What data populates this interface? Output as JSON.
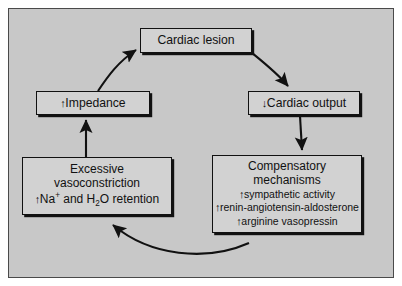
{
  "figure": {
    "type": "cycle-diagram",
    "background_color": "#c8c8c8",
    "node_fill_color": "#d2d2d2",
    "stroke_color": "#111111"
  },
  "nodes": {
    "cardiac_lesion": {
      "label": "Cardiac lesion"
    },
    "cardiac_output": {
      "arrow": "↓",
      "label": "Cardiac output"
    },
    "impedance": {
      "arrow": "↑",
      "label": "Impedance"
    },
    "vasoconstriction": {
      "line1": "Excessive",
      "line2": "vasoconstriction",
      "arrow": "↑",
      "ion": "Na",
      "ion_charge": "+",
      "mid": " and H",
      "water_sub": "2",
      "tail": "O retention"
    },
    "compensatory": {
      "line1": "Compensatory",
      "line2": "mechanisms",
      "items": [
        {
          "arrow": "↑",
          "label": "sympathetic activity"
        },
        {
          "arrow": "↑",
          "label": "renin-angiotensin-aldosterone"
        },
        {
          "arrow": "↑",
          "label": "arginine vasopressin"
        }
      ]
    }
  },
  "edges": [
    {
      "name": "lesion-to-output",
      "from": "cardiac_lesion",
      "to": "cardiac_output",
      "style": "curved"
    },
    {
      "name": "output-to-compensatory",
      "from": "cardiac_output",
      "to": "compensatory",
      "style": "straight"
    },
    {
      "name": "compensatory-to-vasoconstriction",
      "from": "compensatory",
      "to": "vasoconstriction",
      "style": "curved"
    },
    {
      "name": "vasoconstriction-to-impedance",
      "from": "vasoconstriction",
      "to": "impedance",
      "style": "straight"
    },
    {
      "name": "impedance-to-lesion",
      "from": "impedance",
      "to": "cardiac_lesion",
      "style": "curved"
    }
  ]
}
